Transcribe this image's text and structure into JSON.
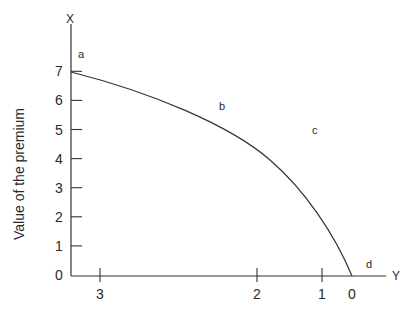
{
  "chart_data": {
    "type": "line",
    "title": "",
    "xlabel": "",
    "ylabel": "Value of the premium",
    "axis_letters": {
      "vertical": "X",
      "horizontal": "Y"
    },
    "y_ticks": [
      "0",
      "1",
      "2",
      "3",
      "4",
      "5",
      "6",
      "7"
    ],
    "x_ticks": [
      {
        "label": "3",
        "px": 100
      },
      {
        "label": "2",
        "px": 257
      },
      {
        "label": "1",
        "px": 322
      },
      {
        "label": "0",
        "px": 352
      }
    ],
    "ylim": [
      0,
      7.6
    ],
    "grid": false,
    "annotations": [
      {
        "label": "a",
        "x": 78,
        "y": 58
      },
      {
        "label": "b",
        "x": 219,
        "y": 110
      },
      {
        "label": "c",
        "x": 312,
        "y": 134
      },
      {
        "label": "d",
        "x": 366,
        "y": 268
      }
    ],
    "series": [
      {
        "name": "premium curve",
        "points_x_axis_value_to_y": [
          {
            "x_label": "3.4 (axis origin)",
            "y": 7.0
          },
          {
            "x_label": "~2.7",
            "y": 5.9
          },
          {
            "x_label": "~2.1",
            "y": 4.8
          },
          {
            "x_label": "~1.3",
            "y": 2.9
          },
          {
            "x_label": "0",
            "y": 0.0
          }
        ]
      }
    ]
  }
}
